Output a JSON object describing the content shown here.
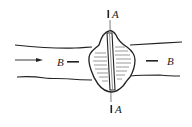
{
  "diagram": {
    "type": "channel plan view with section markers",
    "flow_direction": "left-to-right",
    "section_a": {
      "top_label": "A",
      "bottom_label": "A"
    },
    "section_b": {
      "left_label": "B",
      "right_label": "B"
    },
    "colors": {
      "stroke": "#222222",
      "background": "#ffffff"
    }
  }
}
